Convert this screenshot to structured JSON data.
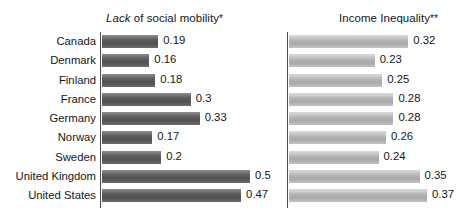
{
  "chart_data": {
    "type": "bar",
    "orientation": "horizontal",
    "title": "",
    "categories": [
      "Canada",
      "Denmark",
      "Finland",
      "France",
      "Germany",
      "Norway",
      "Sweden",
      "United Kingdom",
      "United States"
    ],
    "panels": [
      {
        "title_prefix": "Lack",
        "title_rest": " of social mobility",
        "title_mark": "*",
        "title_full": "Lack of social mobility *",
        "xlabel": "",
        "ylabel": "",
        "xlim": [
          0,
          0.56
        ],
        "grid": false,
        "bar_style": "dark-gray-gradient",
        "values": [
          0.19,
          0.16,
          0.18,
          0.3,
          0.33,
          0.17,
          0.2,
          0.5,
          0.47
        ],
        "value_labels": [
          "0.19",
          "0.16",
          "0.18",
          "0.3",
          "0.33",
          "0.17",
          "0.2",
          "0.5",
          "0.47"
        ]
      },
      {
        "title_prefix": "",
        "title_rest": "Income Inequality",
        "title_mark": "**",
        "title_full": "Income Inequality**",
        "xlabel": "",
        "ylabel": "",
        "xlim": [
          0,
          0.45
        ],
        "grid": false,
        "bar_style": "light-gray-gradient",
        "values": [
          0.32,
          0.23,
          0.25,
          0.28,
          0.28,
          0.26,
          0.24,
          0.35,
          0.37
        ],
        "value_labels": [
          "0.32",
          "0.23",
          "0.25",
          "0.28",
          "0.28",
          "0.26",
          "0.24",
          "0.35",
          "0.37"
        ]
      }
    ],
    "legend": [],
    "colors": {
      "bar_dark": "#5d5d5d",
      "bar_light": "#b4b4b4",
      "axis": "#4f4f4f",
      "text": "#161616",
      "background": "#ffffff"
    }
  }
}
